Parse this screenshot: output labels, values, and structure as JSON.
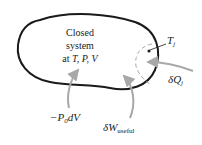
{
  "diagram": {
    "system_label": {
      "line1": "Closed",
      "line2": "system",
      "line3_prefix": "at ",
      "line3_vars": "T, P, V"
    },
    "local_temperature": {
      "symbol": "T",
      "subscript": "j"
    },
    "heat_transfer": {
      "delta": "δ",
      "symbol": "Q",
      "subscript": "j"
    },
    "boundary_work": {
      "text": "−P",
      "subscript": "0",
      "suffix": "dV"
    },
    "useful_work": {
      "delta": "δ",
      "symbol": "W",
      "subscript": "useful"
    },
    "colors": {
      "boundary": "#1a1a1a",
      "arrows": "#a8a8a8",
      "dashed_region": "#a8a8a8",
      "text": "#222222"
    }
  }
}
